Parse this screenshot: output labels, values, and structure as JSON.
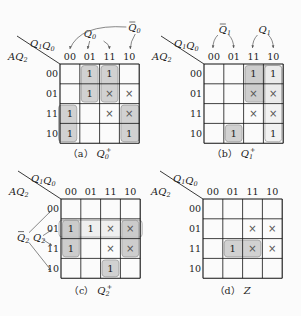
{
  "figure": {
    "col_var": "Q1Q0",
    "row_var": "AQ2",
    "col_headers": [
      "00",
      "01",
      "11",
      "10"
    ],
    "row_headers": [
      "00",
      "01",
      "11",
      "10"
    ],
    "maps": [
      {
        "id": "a",
        "caption_prefix": "（a）",
        "caption_var": "Q",
        "caption_sub": "0",
        "caption_sup": "+",
        "origin": [
          60,
          64
        ],
        "cells": [
          [
            "",
            "1",
            "1",
            ""
          ],
          [
            "",
            "1",
            "×",
            "×"
          ],
          [
            "1",
            "",
            "×",
            "×"
          ],
          [
            "1",
            "",
            "",
            "1"
          ]
        ],
        "groups": [
          {
            "r0": 0,
            "c0": 1,
            "r1": 1,
            "c1": 1,
            "shade": "#c9c9c9"
          },
          {
            "r0": 0,
            "c0": 2,
            "r1": 1,
            "c1": 2,
            "shade": "#c9c9c9"
          },
          {
            "r0": 2,
            "c0": 0,
            "r1": 3,
            "c1": 0,
            "shade": "#c9c9c9",
            "wrap": "left"
          },
          {
            "r0": 2,
            "c0": 3,
            "r1": 3,
            "c1": 3,
            "shade": "#c9c9c9",
            "wrap": "right"
          }
        ],
        "annotations": [
          {
            "label": "Q0",
            "bar": false,
            "type": "arcs-q0"
          },
          {
            "label": "Q0",
            "bar": true,
            "type": "arcs-nq0"
          }
        ]
      },
      {
        "id": "b",
        "caption_prefix": "（b）",
        "caption_var": "Q",
        "caption_sub": "1",
        "caption_sup": "+",
        "origin": [
          204,
          64
        ],
        "cells": [
          [
            "",
            "",
            "1",
            "1"
          ],
          [
            "",
            "",
            "×",
            "×"
          ],
          [
            "",
            "",
            "×",
            "×"
          ],
          [
            "",
            "1",
            "",
            "1"
          ]
        ],
        "groups": [
          {
            "r0": 0,
            "c0": 2,
            "r1": 1,
            "c1": 3,
            "shade": "#c4c4c4"
          },
          {
            "r0": 0,
            "c0": 3,
            "r1": 3,
            "c1": 3,
            "shade": "#f0f0f0"
          },
          {
            "r0": 3,
            "c0": 1,
            "r1": 3,
            "c1": 1,
            "shade": "#c9c9c9"
          }
        ],
        "annotations": [
          {
            "label": "Q1",
            "bar": true,
            "type": "arcs-nq1"
          },
          {
            "label": "Q1",
            "bar": false,
            "type": "arcs-q1"
          }
        ]
      },
      {
        "id": "c",
        "caption_prefix": "（c）",
        "caption_var": "Q",
        "caption_sub": "2",
        "caption_sup": "+",
        "origin": [
          61,
          199
        ],
        "cells": [
          [
            "",
            "",
            "",
            ""
          ],
          [
            "1",
            "1",
            "×",
            "×"
          ],
          [
            "1",
            "",
            "×",
            "×"
          ],
          [
            "",
            "",
            "1",
            ""
          ]
        ],
        "groups": [
          {
            "r0": 1,
            "c0": 0,
            "r1": 1,
            "c1": 3,
            "shade": "#ececec"
          },
          {
            "r0": 1,
            "c0": 0,
            "r1": 2,
            "c1": 0,
            "shade": "#c4c4c4"
          },
          {
            "r0": 1,
            "c0": 3,
            "r1": 2,
            "c1": 3,
            "shade": "#c4c4c4"
          },
          {
            "r0": 3,
            "c0": 2,
            "r1": 3,
            "c1": 2,
            "shade": "#c9c9c9"
          }
        ],
        "annotations": [
          {
            "label": "Q2",
            "bar": true,
            "type": "arrows-nq2"
          },
          {
            "label": "Q2",
            "bar": false,
            "type": "arrows-q2"
          }
        ]
      },
      {
        "id": "d",
        "caption_prefix": "（d）",
        "caption_var": "Z",
        "caption_sub": "",
        "caption_sup": "",
        "origin": [
          203,
          199
        ],
        "cells": [
          [
            "",
            "",
            "",
            ""
          ],
          [
            "",
            "",
            "×",
            "×"
          ],
          [
            "",
            "1",
            "×",
            "×"
          ],
          [
            "",
            "",
            "",
            ""
          ]
        ],
        "groups": [
          {
            "r0": 2,
            "c0": 1,
            "r1": 2,
            "c1": 2,
            "shade": "#c9c9c9"
          }
        ],
        "annotations": []
      }
    ]
  }
}
